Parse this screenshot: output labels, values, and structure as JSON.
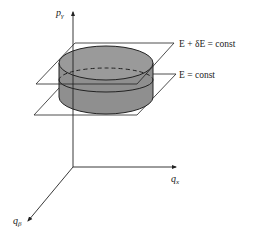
{
  "diagram": {
    "type": "phase-space energy shell",
    "axes": {
      "vertical": {
        "symbol": "p",
        "subscript": "γ"
      },
      "horizontal": {
        "symbol": "q",
        "subscript": "x"
      },
      "depth": {
        "symbol": "q",
        "subscript": "β"
      }
    },
    "planes": {
      "upper": {
        "label": "E + δE = const"
      },
      "lower": {
        "label": "E = const"
      }
    },
    "colors": {
      "line": "#222222",
      "cylinder_fill": "#8f8f8f",
      "cylinder_top": "#9a9a9a",
      "background": "#ffffff"
    }
  }
}
